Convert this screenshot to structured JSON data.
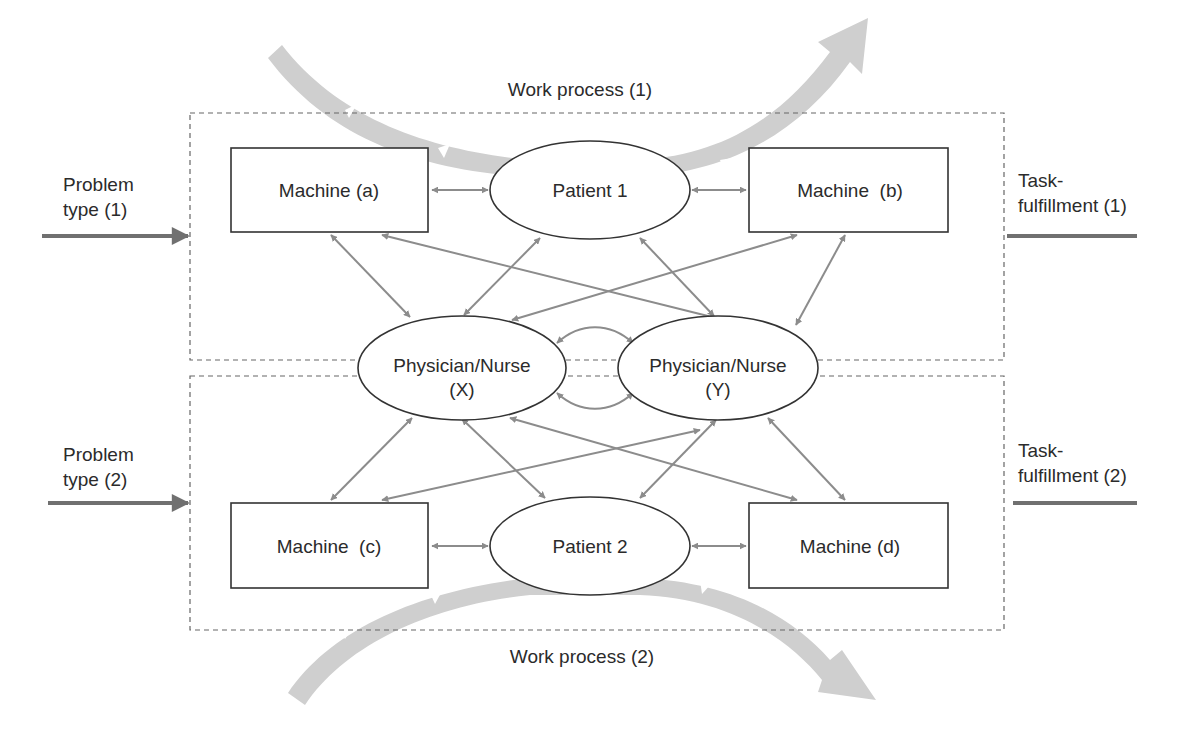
{
  "diagram": {
    "type": "work-process-interaction-diagram",
    "colors": {
      "background": "#ffffff",
      "node_stroke": "#333333",
      "connector": "#8c8c8c",
      "flow_arrow": "#cfcfcf",
      "io_arrow": "#707070",
      "dashed_border": "#666666"
    },
    "work_processes": [
      {
        "id": "wp1",
        "label": "Work process (1)"
      },
      {
        "id": "wp2",
        "label": "Work process (2)"
      }
    ],
    "inputs": [
      {
        "id": "in1",
        "line1": "Problem",
        "line2": "type (1)"
      },
      {
        "id": "in2",
        "line1": "Problem",
        "line2": "type (2)"
      }
    ],
    "outputs": [
      {
        "id": "out1",
        "line1": "Task-",
        "line2": "fulfillment (1)"
      },
      {
        "id": "out2",
        "line1": "Task-",
        "line2": "fulfillment (2)"
      }
    ],
    "nodes": {
      "machine_a": {
        "label": "Machine (a)",
        "shape": "rectangle"
      },
      "machine_b": {
        "label": "Machine  (b)",
        "shape": "rectangle"
      },
      "machine_c": {
        "label": "Machine  (c)",
        "shape": "rectangle"
      },
      "machine_d": {
        "label": "Machine (d)",
        "shape": "rectangle"
      },
      "patient_1": {
        "label": "Patient 1",
        "shape": "ellipse"
      },
      "patient_2": {
        "label": "Patient 2",
        "shape": "ellipse"
      },
      "physician_x": {
        "line1": "Physician/Nurse",
        "line2": "(X)",
        "shape": "ellipse"
      },
      "physician_y": {
        "line1": "Physician/Nurse",
        "line2": "(Y)",
        "shape": "ellipse"
      }
    },
    "edges": [
      {
        "from": "machine_a",
        "to": "patient_1",
        "type": "bidirectional"
      },
      {
        "from": "patient_1",
        "to": "machine_b",
        "type": "bidirectional"
      },
      {
        "from": "machine_c",
        "to": "patient_2",
        "type": "bidirectional"
      },
      {
        "from": "patient_2",
        "to": "machine_d",
        "type": "bidirectional"
      },
      {
        "from": "machine_a",
        "to": "physician_x",
        "type": "bidirectional"
      },
      {
        "from": "machine_a",
        "to": "physician_y",
        "type": "bidirectional"
      },
      {
        "from": "patient_1",
        "to": "physician_x",
        "type": "bidirectional"
      },
      {
        "from": "patient_1",
        "to": "physician_y",
        "type": "bidirectional"
      },
      {
        "from": "machine_b",
        "to": "physician_x",
        "type": "bidirectional"
      },
      {
        "from": "machine_b",
        "to": "physician_y",
        "type": "bidirectional"
      },
      {
        "from": "machine_c",
        "to": "physician_x",
        "type": "bidirectional"
      },
      {
        "from": "machine_c",
        "to": "physician_y",
        "type": "bidirectional"
      },
      {
        "from": "patient_2",
        "to": "physician_x",
        "type": "bidirectional"
      },
      {
        "from": "patient_2",
        "to": "physician_y",
        "type": "bidirectional"
      },
      {
        "from": "machine_d",
        "to": "physician_x",
        "type": "bidirectional"
      },
      {
        "from": "machine_d",
        "to": "physician_y",
        "type": "bidirectional"
      },
      {
        "from": "physician_x",
        "to": "physician_y",
        "type": "bidirectional-curved-top"
      },
      {
        "from": "physician_x",
        "to": "physician_y",
        "type": "bidirectional-curved-bottom"
      }
    ]
  }
}
